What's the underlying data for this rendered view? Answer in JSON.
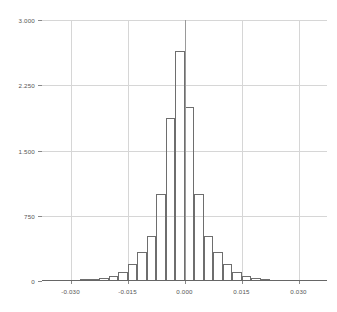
{
  "chart_data": {
    "type": "bar",
    "title": "",
    "subtitle": "",
    "xlabel": "",
    "ylabel": "",
    "grid": true,
    "legend": "none",
    "xlim": [
      -0.0375,
      0.0375
    ],
    "ylim": [
      0,
      3000
    ],
    "bin_width": 0.0025,
    "x_tick_labels": [
      "-0.030",
      "-0.015",
      "0.000",
      "0.015",
      "0.030"
    ],
    "x_tick_values": [
      -0.03,
      -0.015,
      0.0,
      0.015,
      0.03
    ],
    "y_tick_labels": [
      "0",
      "750",
      "1.500",
      "2.250",
      "3.000"
    ],
    "y_tick_values": [
      0,
      750,
      1500,
      2250,
      3000
    ],
    "bin_centers": [
      -0.03625,
      -0.03375,
      -0.03125,
      -0.02875,
      -0.02625,
      -0.02375,
      -0.02125,
      -0.01875,
      -0.01625,
      -0.01375,
      -0.01125,
      -0.00875,
      -0.00625,
      -0.00375,
      -0.00125,
      0.00125,
      0.00375,
      0.00625,
      0.00875,
      0.01125,
      0.01375,
      0.01625,
      0.01875,
      0.02125,
      0.02375,
      0.02625
    ],
    "values": [
      4,
      5,
      6,
      10,
      18,
      22,
      30,
      55,
      105,
      200,
      330,
      520,
      1000,
      1870,
      2640,
      2000,
      1000,
      520,
      330,
      200,
      105,
      55,
      30,
      18,
      10,
      5
    ],
    "annotations": [
      {
        "name": "center-rule",
        "x": 0.0,
        "y_top": 3000,
        "description": "vertical rule at x = 0.000"
      }
    ]
  },
  "axes": {
    "y_axis_name": "frequency-axis",
    "x_axis_name": "value-axis"
  }
}
